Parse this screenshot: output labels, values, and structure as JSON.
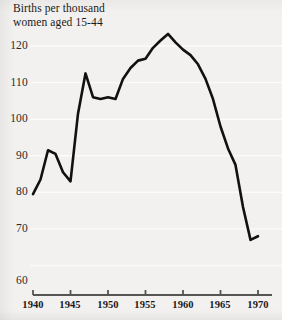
{
  "figure": {
    "background_color": "#f2f1ef",
    "line_color": "#111111",
    "gridline_color": "#fbfbfa",
    "axis_color": "#555555",
    "title_line_1": "Births per thousand",
    "title_line_2": "women aged 15-44"
  },
  "chart_data": {
    "type": "line",
    "title": "Births per thousand women aged 15-44",
    "xlabel": "",
    "ylabel": "Births per thousand women aged 15-44",
    "xlim": [
      1940,
      1970
    ],
    "ylim": [
      56,
      125
    ],
    "grid": true,
    "legend": null,
    "x_tick_labels": [
      "1940",
      "1945",
      "1950",
      "1955",
      "1960",
      "1965",
      "1970"
    ],
    "x_ticks": [
      1940,
      1945,
      1950,
      1955,
      1960,
      1965,
      1970
    ],
    "y_tick_labels": [
      "60",
      "70",
      "80",
      "90",
      "100",
      "110",
      "120"
    ],
    "y_ticks": [
      60,
      70,
      80,
      90,
      100,
      110,
      120
    ],
    "x": [
      1940,
      1941,
      1942,
      1943,
      1944,
      1945,
      1946,
      1947,
      1948,
      1949,
      1950,
      1951,
      1952,
      1953,
      1954,
      1955,
      1956,
      1957,
      1958,
      1959,
      1960,
      1961,
      1962,
      1963,
      1964,
      1965,
      1966,
      1967,
      1968,
      1969,
      1970
    ],
    "values": [
      79.5,
      83.5,
      91.5,
      90.5,
      85.5,
      83.0,
      101.5,
      112.5,
      106.0,
      105.5,
      106.0,
      105.5,
      111.0,
      114.0,
      116.0,
      116.5,
      119.5,
      121.5,
      123.3,
      121.0,
      119.0,
      117.5,
      115.0,
      111.0,
      105.5,
      98.0,
      92.0,
      87.5,
      76.0,
      67.0,
      68.0
    ],
    "series": [
      {
        "name": "Births per thousand women aged 15-44",
        "values": [
          79.5,
          83.5,
          91.5,
          90.5,
          85.5,
          83.0,
          101.5,
          112.5,
          106.0,
          105.5,
          106.0,
          105.5,
          111.0,
          114.0,
          116.0,
          116.5,
          119.5,
          121.5,
          123.3,
          121.0,
          119.0,
          117.5,
          115.0,
          111.0,
          105.5,
          98.0,
          92.0,
          87.5,
          76.0,
          67.0,
          68.0
        ]
      }
    ],
    "annotations": {
      "peak_year": 1958,
      "peak_value": 123.3,
      "trough_year": 1969,
      "trough_value": 67.0
    }
  },
  "y_axis": {
    "labels": [
      {
        "text": "120",
        "top": 39
      },
      {
        "text": "110",
        "top": 76
      },
      {
        "text": "100",
        "top": 112
      },
      {
        "text": "90",
        "top": 149
      },
      {
        "text": "80",
        "top": 185
      },
      {
        "text": "70",
        "top": 222
      },
      {
        "text": "60",
        "top": 274
      }
    ]
  },
  "x_axis": {
    "labels": [
      {
        "text": "1940",
        "left": 13
      },
      {
        "text": "1945",
        "left": 50
      },
      {
        "text": "1950",
        "left": 88
      },
      {
        "text": "1955",
        "left": 125
      },
      {
        "text": "1960",
        "left": 163
      },
      {
        "text": "1965",
        "left": 200
      },
      {
        "text": "1970",
        "left": 238
      }
    ]
  }
}
